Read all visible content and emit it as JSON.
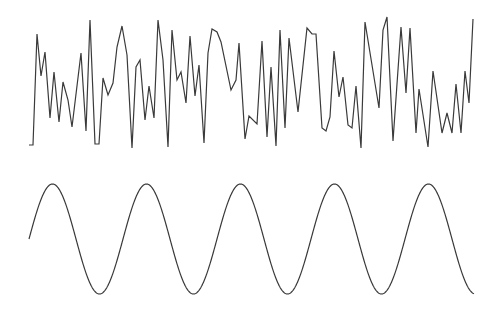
{
  "chart_data": [
    {
      "type": "line",
      "title": "",
      "xlabel": "",
      "ylabel": "",
      "grid": false,
      "legend": null,
      "description": "Random noise signal (top panel)",
      "color": "#3a3a3a",
      "x_px_range": [
        29,
        473
      ],
      "y_px_range": [
        17,
        148
      ],
      "points_px": [
        [
          29,
          145
        ],
        [
          33,
          145
        ],
        [
          37,
          34
        ],
        [
          41,
          76
        ],
        [
          45,
          52
        ],
        [
          50,
          118
        ],
        [
          54,
          72
        ],
        [
          59,
          122
        ],
        [
          63,
          82
        ],
        [
          68,
          100
        ],
        [
          72,
          127
        ],
        [
          81,
          53
        ],
        [
          86,
          131
        ],
        [
          90,
          20
        ],
        [
          95,
          144
        ],
        [
          99,
          144
        ],
        [
          103,
          78
        ],
        [
          108,
          95
        ],
        [
          113,
          83
        ],
        [
          117,
          47
        ],
        [
          122,
          26
        ],
        [
          127,
          55
        ],
        [
          132,
          148
        ],
        [
          136,
          67
        ],
        [
          140,
          60
        ],
        [
          145,
          120
        ],
        [
          149,
          86
        ],
        [
          154,
          118
        ],
        [
          158,
          20
        ],
        [
          163,
          60
        ],
        [
          168,
          147
        ],
        [
          172,
          30
        ],
        [
          177,
          80
        ],
        [
          181,
          72
        ],
        [
          186,
          103
        ],
        [
          190,
          36
        ],
        [
          195,
          96
        ],
        [
          199,
          65
        ],
        [
          204,
          143
        ],
        [
          208,
          53
        ],
        [
          212,
          29
        ],
        [
          217,
          32
        ],
        [
          221,
          42
        ],
        [
          231,
          90
        ],
        [
          236,
          80
        ],
        [
          239,
          43
        ],
        [
          245,
          139
        ],
        [
          249,
          116
        ],
        [
          257,
          124
        ],
        [
          262,
          41
        ],
        [
          267,
          137
        ],
        [
          271,
          67
        ],
        [
          276,
          146
        ],
        [
          280,
          30
        ],
        [
          285,
          128
        ],
        [
          289,
          38
        ],
        [
          298,
          112
        ],
        [
          307,
          28
        ],
        [
          312,
          34
        ],
        [
          316,
          34
        ],
        [
          322,
          128
        ],
        [
          326,
          131
        ],
        [
          330,
          117
        ],
        [
          334,
          51
        ],
        [
          339,
          97
        ],
        [
          343,
          77
        ],
        [
          348,
          125
        ],
        [
          352,
          128
        ],
        [
          356,
          86
        ],
        [
          361,
          148
        ],
        [
          365,
          22
        ],
        [
          379,
          108
        ],
        [
          383,
          30
        ],
        [
          387,
          17
        ],
        [
          393,
          141
        ],
        [
          401,
          27
        ],
        [
          406,
          93
        ],
        [
          410,
          28
        ],
        [
          416,
          133
        ],
        [
          419,
          89
        ],
        [
          428,
          147
        ],
        [
          433,
          71
        ],
        [
          442,
          133
        ],
        [
          447,
          113
        ],
        [
          452,
          133
        ],
        [
          456,
          84
        ],
        [
          461,
          133
        ],
        [
          465,
          71
        ],
        [
          469,
          103
        ],
        [
          473,
          19
        ]
      ]
    },
    {
      "type": "line",
      "title": "",
      "xlabel": "",
      "ylabel": "",
      "grid": false,
      "legend": null,
      "description": "Sine wave (bottom panel)",
      "color": "#3a3a3a",
      "x_start_px": 29,
      "x_end_px": 474,
      "center_y_px": 239,
      "amplitude_px": 55,
      "period_px": 94,
      "phase": 0,
      "cycles": 4.73,
      "peaks_px": [
        [
          52,
          184
        ],
        [
          146,
          184
        ],
        [
          241,
          184
        ],
        [
          335,
          183
        ],
        [
          429,
          183
        ]
      ],
      "troughs_px": [
        [
          100,
          294
        ],
        [
          193,
          294
        ],
        [
          289,
          293
        ],
        [
          382,
          293
        ]
      ]
    }
  ]
}
